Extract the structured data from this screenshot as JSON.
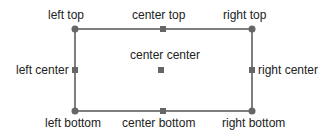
{
  "diagram": {
    "colors": {
      "line": "#555555",
      "marker": "#666666",
      "text": "#222222"
    },
    "rect": {
      "x": 75,
      "y": 29,
      "w": 177,
      "h": 82
    },
    "labels": {
      "left_top": "left top",
      "center_top": "center top",
      "right_top": "right top",
      "left_center": "left center",
      "center_center": "center center",
      "right_center": "right center",
      "left_bottom": "left bottom",
      "center_bottom": "center bottom",
      "right_bottom": "right bottom"
    }
  }
}
